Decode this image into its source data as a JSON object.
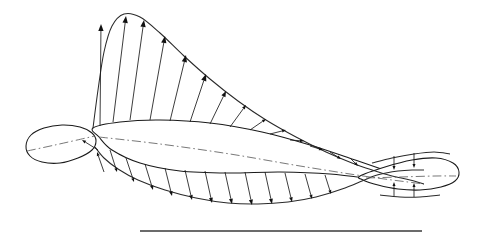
{
  "figure": {
    "background_color": "#ffffff",
    "line_color": "#1a1a1a",
    "envelope_color": "#2a2a2a",
    "chordline_color": "#555555",
    "baseline_color": "#3a3a3a"
  },
  "chart_data": {
    "type": "line",
    "subtitle": "",
    "xlabel": "",
    "ylabel": "",
    "grid": false,
    "legend_position": "none",
    "xlim": [
      0,
      481
    ],
    "ylim": [
      246,
      0
    ],
    "annotations": [],
    "elements": [
      {
        "name": "leading-edge-slat",
        "kind": "body-outline",
        "points": [
          [
            26,
            146
          ],
          [
            31,
            135
          ],
          [
            44,
            128
          ],
          [
            62,
            125
          ],
          [
            80,
            127
          ],
          [
            92,
            133
          ],
          [
            96,
            141
          ],
          [
            92,
            150
          ],
          [
            78,
            158
          ],
          [
            60,
            163
          ],
          [
            42,
            162
          ],
          [
            30,
            156
          ],
          [
            26,
            146
          ]
        ]
      },
      {
        "name": "main-airfoil-body",
        "kind": "body-outline",
        "points": [
          [
            93,
            128
          ],
          [
            120,
            122
          ],
          [
            160,
            120
          ],
          [
            210,
            123
          ],
          [
            262,
            132
          ],
          [
            310,
            145
          ],
          [
            352,
            159
          ],
          [
            390,
            172
          ],
          [
            418,
            182
          ],
          [
            424,
            184
          ],
          [
            415,
            184
          ],
          [
            380,
            180
          ],
          [
            330,
            174
          ],
          [
            280,
            172
          ],
          [
            228,
            173
          ],
          [
            180,
            171
          ],
          [
            140,
            163
          ],
          [
            112,
            150
          ],
          [
            99,
            137
          ],
          [
            93,
            128
          ]
        ]
      },
      {
        "name": "trailing-edge-flap",
        "kind": "body-outline",
        "points": [
          [
            360,
            176
          ],
          [
            385,
            167
          ],
          [
            412,
            160
          ],
          [
            436,
            158
          ],
          [
            453,
            163
          ],
          [
            459,
            172
          ],
          [
            455,
            181
          ],
          [
            441,
            187
          ],
          [
            420,
            190
          ],
          [
            398,
            189
          ],
          [
            378,
            185
          ],
          [
            363,
            180
          ],
          [
            360,
            176
          ]
        ]
      },
      {
        "name": "main-chord-line",
        "kind": "chordline",
        "points": [
          [
            99,
            137
          ],
          [
            160,
            144
          ],
          [
            230,
            154
          ],
          [
            300,
            166
          ],
          [
            370,
            177
          ],
          [
            424,
            184
          ]
        ]
      },
      {
        "name": "slat-chord-line",
        "kind": "chordline",
        "points": [
          [
            27,
            151
          ],
          [
            55,
            145
          ],
          [
            86,
            138
          ],
          [
            95,
            136
          ]
        ]
      },
      {
        "name": "flap-chord-line",
        "kind": "chordline",
        "points": [
          [
            366,
            178
          ],
          [
            400,
            177
          ],
          [
            435,
            176
          ],
          [
            456,
            176
          ]
        ]
      },
      {
        "name": "upper-surface-pressure-envelope",
        "kind": "envelope",
        "points": [
          [
            93,
            128
          ],
          [
            98,
            90
          ],
          [
            104,
            52
          ],
          [
            112,
            26
          ],
          [
            124,
            14
          ],
          [
            140,
            17
          ],
          [
            160,
            33
          ],
          [
            184,
            56
          ],
          [
            210,
            79
          ],
          [
            238,
            101
          ],
          [
            266,
            120
          ],
          [
            296,
            137
          ],
          [
            326,
            152
          ],
          [
            352,
            163
          ],
          [
            372,
            170
          ],
          [
            392,
            176
          ],
          [
            410,
            180
          ],
          [
            424,
            184
          ]
        ]
      },
      {
        "name": "lower-surface-pressure-envelope",
        "kind": "envelope",
        "points": [
          [
            95,
            147
          ],
          [
            104,
            158
          ],
          [
            118,
            169
          ],
          [
            138,
            180
          ],
          [
            165,
            190
          ],
          [
            196,
            198
          ],
          [
            228,
            203
          ],
          [
            258,
            204
          ],
          [
            288,
            202
          ],
          [
            316,
            197
          ],
          [
            342,
            189
          ],
          [
            362,
            181
          ],
          [
            374,
            176
          ],
          [
            386,
            173
          ],
          [
            398,
            171
          ],
          [
            412,
            170
          ],
          [
            424,
            170
          ]
        ]
      },
      {
        "name": "flap-upper-pressure-envelope",
        "kind": "envelope",
        "points": [
          [
            372,
            163
          ],
          [
            392,
            158
          ],
          [
            414,
            154
          ],
          [
            434,
            152
          ],
          [
            450,
            154
          ]
        ]
      },
      {
        "name": "flap-lower-pressure-envelope",
        "kind": "envelope",
        "points": [
          [
            380,
            195
          ],
          [
            400,
            197
          ],
          [
            420,
            197
          ],
          [
            440,
            195
          ]
        ]
      },
      {
        "name": "baseline-reference-rule",
        "kind": "rule",
        "points": [
          [
            140,
            231
          ],
          [
            422,
            231
          ]
        ]
      }
    ],
    "series": [
      {
        "name": "upper-surface-suction-vectors",
        "direction": "outward-up",
        "count": 14,
        "note": "Arrows point away from the upper surface; length proportional to suction magnitude, peaking near the leading edge.",
        "vectors": [
          {
            "x0": 100,
            "y0": 126,
            "x1": 101,
            "y1": 24
          },
          {
            "x0": 113,
            "y0": 122,
            "x1": 126,
            "y1": 16
          },
          {
            "x0": 130,
            "y0": 120,
            "x1": 144,
            "y1": 20
          },
          {
            "x0": 150,
            "y0": 120,
            "x1": 165,
            "y1": 36
          },
          {
            "x0": 170,
            "y0": 121,
            "x1": 186,
            "y1": 55
          },
          {
            "x0": 190,
            "y0": 122,
            "x1": 206,
            "y1": 74
          },
          {
            "x0": 210,
            "y0": 124,
            "x1": 226,
            "y1": 91
          },
          {
            "x0": 230,
            "y0": 127,
            "x1": 246,
            "y1": 105
          },
          {
            "x0": 250,
            "y0": 130,
            "x1": 266,
            "y1": 119
          },
          {
            "x0": 270,
            "y0": 134,
            "x1": 286,
            "y1": 130
          },
          {
            "x0": 290,
            "y0": 140,
            "x1": 304,
            "y1": 141
          },
          {
            "x0": 310,
            "y0": 146,
            "x1": 323,
            "y1": 150
          },
          {
            "x0": 330,
            "y0": 152,
            "x1": 341,
            "y1": 159
          },
          {
            "x0": 350,
            "y0": 158,
            "x1": 358,
            "y1": 166
          }
        ]
      },
      {
        "name": "lower-surface-pressure-vectors",
        "direction": "outward-down",
        "count": 12,
        "note": "Arrows point away from the lower surface, indicating positive pressure under the section.",
        "vectors": [
          {
            "x0": 110,
            "y0": 150,
            "x1": 117,
            "y1": 172
          },
          {
            "x0": 126,
            "y0": 158,
            "x1": 134,
            "y1": 182
          },
          {
            "x0": 145,
            "y0": 164,
            "x1": 153,
            "y1": 190
          },
          {
            "x0": 165,
            "y0": 168,
            "x1": 172,
            "y1": 196
          },
          {
            "x0": 185,
            "y0": 170,
            "x1": 192,
            "y1": 200
          },
          {
            "x0": 205,
            "y0": 171,
            "x1": 212,
            "y1": 203
          },
          {
            "x0": 225,
            "y0": 172,
            "x1": 232,
            "y1": 204
          },
          {
            "x0": 245,
            "y0": 172,
            "x1": 252,
            "y1": 205
          },
          {
            "x0": 265,
            "y0": 172,
            "x1": 272,
            "y1": 204
          },
          {
            "x0": 285,
            "y0": 173,
            "x1": 292,
            "y1": 202
          },
          {
            "x0": 305,
            "y0": 174,
            "x1": 312,
            "y1": 199
          },
          {
            "x0": 325,
            "y0": 175,
            "x1": 331,
            "y1": 194
          }
        ]
      },
      {
        "name": "flap-upper-surface-vectors",
        "direction": "inward-down",
        "count": 2,
        "note": "Short arrows on the flap upper surface.",
        "vectors": [
          {
            "x0": 394,
            "y0": 156,
            "x1": 394,
            "y1": 170
          },
          {
            "x0": 414,
            "y0": 153,
            "x1": 414,
            "y1": 168
          }
        ]
      },
      {
        "name": "flap-lower-surface-vectors",
        "direction": "inward-up",
        "count": 2,
        "note": "Short arrows under the flap pointing toward the surface.",
        "vectors": [
          {
            "x0": 394,
            "y0": 196,
            "x1": 394,
            "y1": 182
          },
          {
            "x0": 414,
            "y0": 197,
            "x1": 414,
            "y1": 183
          }
        ]
      },
      {
        "name": "slat-slot-vectors",
        "direction": "toward-slot",
        "count": 2,
        "note": "Two short vectors in the slat slot region near the main-element leading edge.",
        "vectors": [
          {
            "x0": 98,
            "y0": 150,
            "x1": 82,
            "y1": 140
          },
          {
            "x0": 104,
            "y0": 172,
            "x1": 97,
            "y1": 152
          }
        ]
      }
    ]
  }
}
